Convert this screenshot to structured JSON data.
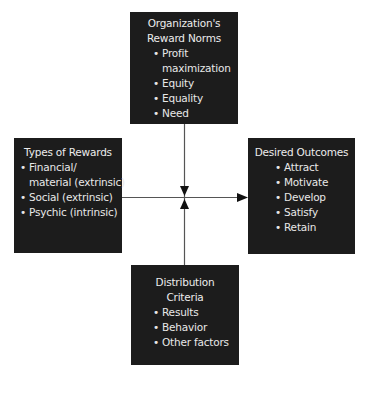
{
  "diagram": {
    "type": "flow",
    "boxes": {
      "top": {
        "title_lines": [
          "Organization's",
          "Reward Norms"
        ],
        "items": [
          {
            "line1": "Profit",
            "line2": "maximization"
          },
          {
            "line1": "Equity"
          },
          {
            "line1": "Equality"
          },
          {
            "line1": "Need"
          }
        ]
      },
      "left": {
        "title_lines": [
          "Types of Rewards"
        ],
        "items": [
          {
            "line1": "Financial/",
            "line2": "material (extrinsic)"
          },
          {
            "line1": "Social (extrinsic)"
          },
          {
            "line1": "Psychic (intrinsic)"
          }
        ]
      },
      "right": {
        "title_lines": [
          "Desired Outcomes"
        ],
        "items": [
          {
            "line1": "Attract"
          },
          {
            "line1": "Motivate"
          },
          {
            "line1": "Develop"
          },
          {
            "line1": "Satisfy"
          },
          {
            "line1": "Retain"
          }
        ]
      },
      "bottom": {
        "title_lines": [
          "Distribution",
          "Criteria"
        ],
        "items": [
          {
            "line1": "Results"
          },
          {
            "line1": "Behavior"
          },
          {
            "line1": "Other factors"
          }
        ]
      }
    },
    "edges": [
      {
        "from": "top",
        "to": "center",
        "arrow": "down"
      },
      {
        "from": "bottom",
        "to": "center",
        "arrow": "up"
      },
      {
        "from": "left",
        "to": "right",
        "arrow": "right"
      }
    ],
    "colors": {
      "box_fill": "#1c1c1c",
      "box_text": "#e8e8e8",
      "line": "#555555",
      "arrowhead": "#111111",
      "background": "#ffffff"
    }
  }
}
